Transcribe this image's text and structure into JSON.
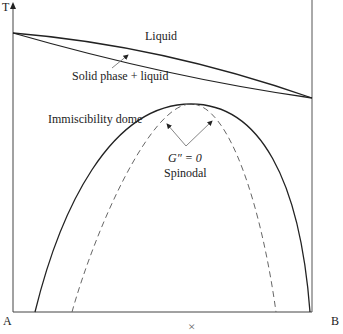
{
  "diagram": {
    "axes": {
      "y_label": "T",
      "left_label": "A",
      "right_label": "B",
      "x_marker": "×"
    },
    "labels": {
      "liquid": "Liquid",
      "solid_liquid": "Solid phase + liquid",
      "immiscibility": "Immiscibility dome",
      "spinodal_condition": "G″ = 0",
      "spinodal": "Spinodal"
    },
    "colors": {
      "line": "#222222",
      "dashed": "#666666",
      "arrow": "#777777"
    }
  }
}
